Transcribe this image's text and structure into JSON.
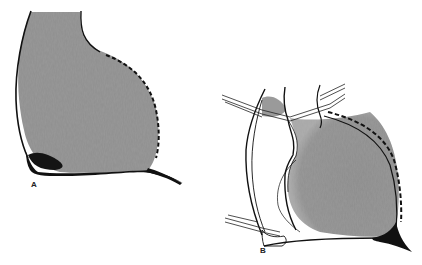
{
  "figure": {
    "type": "anatomical line drawing",
    "panels": [
      {
        "label": "A",
        "description": "Shaded chamber silhouette with solid left/top outline, dashed right border, dark base wedge and tapering tail"
      },
      {
        "label": "B",
        "description": "Outlined structure with crossing paired lines (vessels), shaded chamber region, dashed right border and dark tapering base"
      }
    ],
    "colors": {
      "fill": "#8f8f8f",
      "outline": "#111111",
      "background": "#ffffff"
    }
  }
}
